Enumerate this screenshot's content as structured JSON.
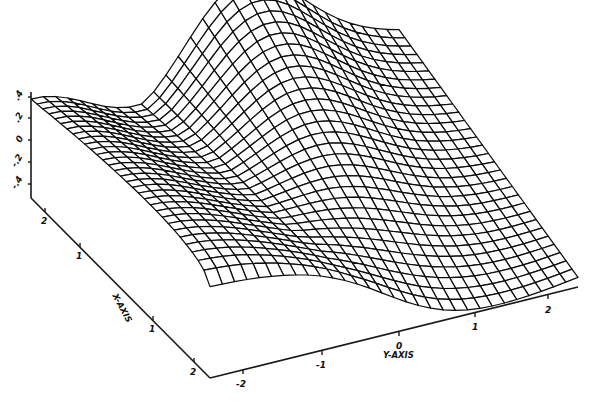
{
  "chart_data": {
    "type": "surface3d",
    "title": "",
    "style": "wireframe mesh, black lines on white",
    "xlabel": "X-AXIS",
    "ylabel": "Y-AXIS",
    "zlabel": "",
    "x_ticks": [
      "-2",
      "-1",
      "0",
      "1",
      "2"
    ],
    "y_ticks": [
      "-2",
      "-1",
      "0",
      "1",
      "2"
    ],
    "z_ticks": [
      ".4",
      ".2",
      "0",
      "-.2",
      "-.4"
    ],
    "xlim": [
      -2.3,
      2.3
    ],
    "ylim": [
      -2.3,
      2.3
    ],
    "grid_lines": 30,
    "colors": {
      "line": "#0d0d0d",
      "background": "#ffffff"
    }
  },
  "axes": {
    "x_title": "X-AXIS",
    "y_title": "Y-AXIS",
    "x_tick_labels": [
      "2",
      "1",
      "0",
      "1",
      "2"
    ],
    "y_tick_labels": [
      "-2",
      "-1",
      "0",
      "1",
      "2"
    ],
    "z_tick_labels": [
      ".4",
      ".2",
      "0",
      "-.2",
      "-.4"
    ]
  }
}
